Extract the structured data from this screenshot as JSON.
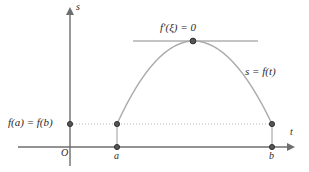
{
  "figure": {
    "background_color": "#ffffff"
  },
  "axes": {
    "y_axis_label": "s",
    "x_axis_label": "t",
    "origin_label": "O",
    "axis_color": "#6e6e6e",
    "x_axis_y": 147,
    "y_axis_x": 70,
    "x_axis_start": 18,
    "x_axis_end": 300,
    "y_axis_top": 10,
    "y_axis_bottom": 166
  },
  "ticks": [
    {
      "label": "a",
      "x": 117
    },
    {
      "label": "b",
      "x": 272
    }
  ],
  "labels": {
    "value_label": "f(a) = f(b)",
    "tangent_label": "f′(ξ) = 0",
    "curve_label": "s = f(t)"
  },
  "curve": {
    "color": "#a9a9a9",
    "start": {
      "x": 117,
      "y": 124
    },
    "vertex": {
      "x": 193,
      "y": 41
    },
    "end": {
      "x": 272,
      "y": 124
    },
    "type": "parabola"
  },
  "tangent_line": {
    "color": "#8a8a8a",
    "y": 41,
    "x_start": 133,
    "x_end": 258
  },
  "level_line": {
    "style": "dotted",
    "color": "#b5b5b5",
    "y": 124,
    "x_start": 70,
    "x_end": 272
  },
  "drop_lines": {
    "color": "#9a9a9a",
    "segments": [
      {
        "x": 117,
        "y_top": 124,
        "y_bottom": 147
      },
      {
        "x": 272,
        "y_top": 124,
        "y_bottom": 147
      }
    ]
  },
  "points": [
    {
      "name": "y-intercept-value",
      "x": 70,
      "y": 124
    },
    {
      "name": "point-a-on-curve",
      "x": 117,
      "y": 124
    },
    {
      "name": "point-b-on-curve",
      "x": 272,
      "y": 124
    },
    {
      "name": "point-a-on-axis",
      "x": 117,
      "y": 147
    },
    {
      "name": "point-b-on-axis",
      "x": 272,
      "y": 147
    },
    {
      "name": "point-vertex-xi",
      "x": 193,
      "y": 41
    }
  ],
  "point_style": {
    "fill": "#555555",
    "stroke": "#2b2b2b",
    "radius": 2.6
  }
}
